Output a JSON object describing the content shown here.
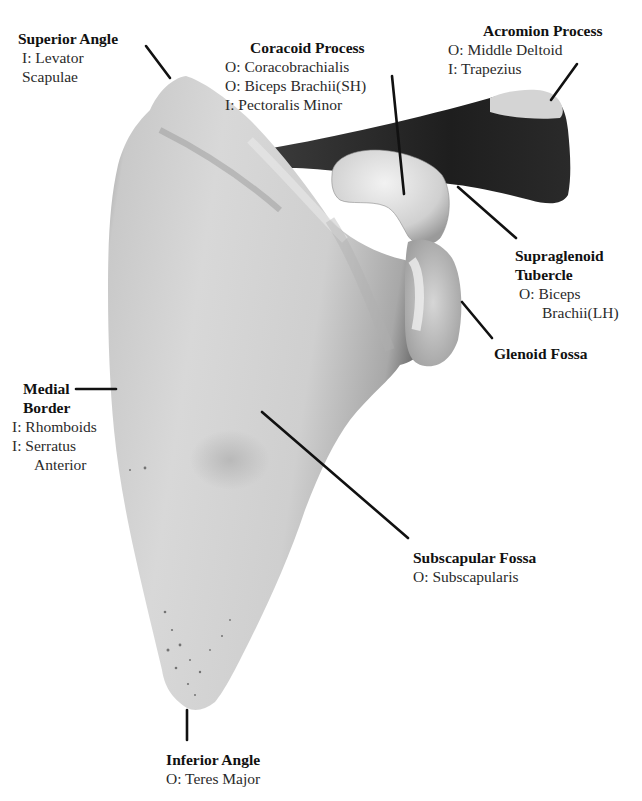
{
  "diagram": {
    "colors": {
      "background": "#ffffff",
      "text": "#1a1a1a",
      "leader_lines": "#111111",
      "bone_light": "#d9d9d9",
      "bone_shadow": "#3a3a3a"
    },
    "labels": {
      "superior_angle": {
        "title": "Superior Angle",
        "lines": [
          "I: Levator",
          "Scapulae"
        ]
      },
      "coracoid_process": {
        "title": "Coracoid Process",
        "lines": [
          "O: Coracobrachialis",
          "O: Biceps Brachii(SH)",
          "I: Pectoralis Minor"
        ]
      },
      "acromion_process": {
        "title": "Acromion Process",
        "lines": [
          "O: Middle Deltoid",
          "I: Trapezius"
        ]
      },
      "supraglenoid_tubercle": {
        "title_line1": "Supraglenoid",
        "title_line2": "Tubercle",
        "lines": [
          "O: Biceps",
          "Brachii(LH)"
        ]
      },
      "glenoid_fossa": {
        "title": "Glenoid Fossa"
      },
      "medial_border": {
        "title_line1": "Medial",
        "title_line2": "Border",
        "lines": [
          "I: Rhomboids",
          "I: Serratus",
          "Anterior"
        ]
      },
      "subscapular_fossa": {
        "title": "Subscapular Fossa",
        "lines": [
          "O: Subscapularis"
        ]
      },
      "inferior_angle": {
        "title": "Inferior Angle",
        "lines": [
          "O: Teres Major"
        ]
      }
    }
  }
}
